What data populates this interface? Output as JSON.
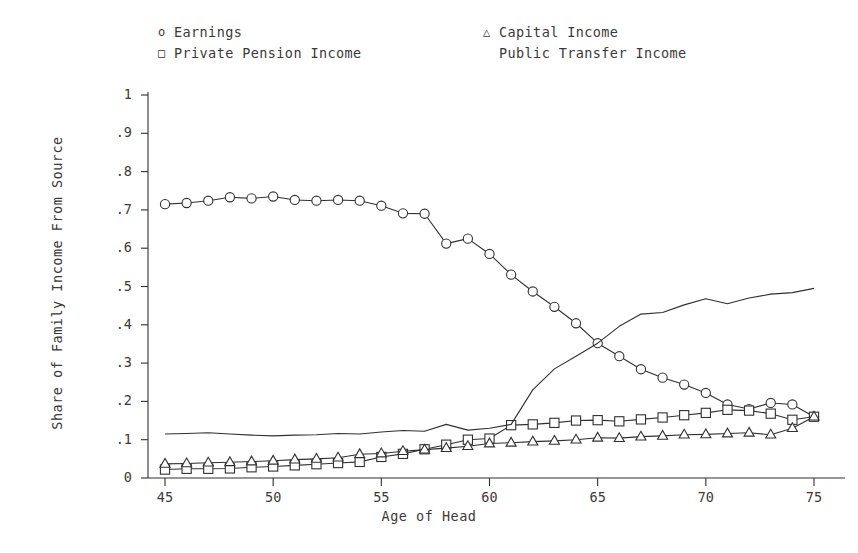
{
  "chart_data": {
    "type": "line",
    "title": "",
    "xlabel": "Age of Head",
    "ylabel": "Share of Family Income From Source",
    "xlim": [
      45,
      75
    ],
    "ylim": [
      0,
      1
    ],
    "xticks": [
      45,
      50,
      55,
      60,
      65,
      70,
      75
    ],
    "xtick_labels": [
      "45",
      "50",
      "55",
      "60",
      "65",
      "70",
      "75"
    ],
    "yticks": [
      0,
      0.1,
      0.2,
      0.3,
      0.4,
      0.5,
      0.6,
      0.7,
      0.8,
      0.9,
      1
    ],
    "ytick_labels": [
      "0",
      ".1",
      ".2",
      ".3",
      ".4",
      ".5",
      ".6",
      ".7",
      ".8",
      ".9",
      "1"
    ],
    "grid": false,
    "legend_position": "top",
    "x": [
      45,
      46,
      47,
      48,
      49,
      50,
      51,
      52,
      53,
      54,
      55,
      56,
      57,
      58,
      59,
      60,
      61,
      62,
      63,
      64,
      65,
      66,
      67,
      68,
      69,
      70,
      71,
      72,
      73,
      74,
      75
    ],
    "series": [
      {
        "name": "Earnings",
        "marker": "circle",
        "marker_glyph": "o",
        "color": "#303030",
        "values": [
          0.715,
          0.718,
          0.724,
          0.733,
          0.73,
          0.735,
          0.726,
          0.724,
          0.726,
          0.724,
          0.711,
          0.691,
          0.69,
          0.612,
          0.625,
          0.585,
          0.531,
          0.487,
          0.447,
          0.404,
          0.352,
          0.318,
          0.284,
          0.262,
          0.244,
          0.222,
          0.192,
          0.18,
          0.196,
          0.192,
          0.16
        ]
      },
      {
        "name": "Private Pension Income",
        "marker": "square",
        "marker_glyph": "□",
        "color": "#303030",
        "values": [
          0.022,
          0.024,
          0.024,
          0.025,
          0.028,
          0.03,
          0.033,
          0.036,
          0.039,
          0.042,
          0.055,
          0.063,
          0.075,
          0.087,
          0.1,
          0.103,
          0.138,
          0.14,
          0.144,
          0.15,
          0.151,
          0.148,
          0.153,
          0.158,
          0.164,
          0.17,
          0.178,
          0.176,
          0.168,
          0.152,
          0.16
        ]
      },
      {
        "name": "Capital Income",
        "marker": "triangle",
        "marker_glyph": "△",
        "color": "#303030",
        "values": [
          0.037,
          0.038,
          0.04,
          0.041,
          0.043,
          0.045,
          0.048,
          0.05,
          0.053,
          0.062,
          0.064,
          0.07,
          0.074,
          0.078,
          0.083,
          0.09,
          0.092,
          0.095,
          0.097,
          0.1,
          0.105,
          0.104,
          0.108,
          0.11,
          0.113,
          0.114,
          0.116,
          0.118,
          0.113,
          0.13,
          0.16
        ]
      },
      {
        "name": "Public Transfer Income",
        "marker": "none",
        "marker_glyph": "",
        "color": "#303030",
        "values": [
          0.115,
          0.116,
          0.118,
          0.115,
          0.112,
          0.11,
          0.112,
          0.113,
          0.116,
          0.115,
          0.12,
          0.124,
          0.122,
          0.14,
          0.125,
          0.13,
          0.14,
          0.23,
          0.285,
          0.318,
          0.352,
          0.396,
          0.428,
          0.432,
          0.452,
          0.468,
          0.455,
          0.47,
          0.48,
          0.484,
          0.495
        ]
      }
    ]
  },
  "legend": {
    "left_column": [
      {
        "marker": "o",
        "label": "Earnings"
      },
      {
        "marker": "□",
        "label": "Private Pension Income"
      }
    ],
    "right_column": [
      {
        "marker": "△",
        "label": "Capital Income"
      },
      {
        "marker": "",
        "label": "Public Transfer Income"
      }
    ]
  }
}
